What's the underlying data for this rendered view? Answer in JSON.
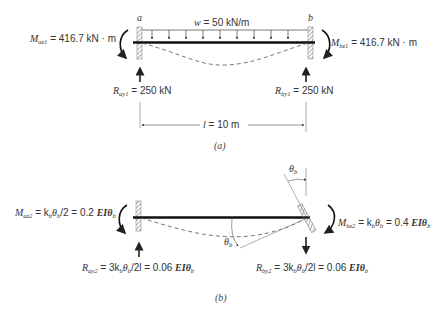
{
  "figure_a": {
    "caption": "(a)",
    "support_a_label": "a",
    "support_b_label": "b",
    "load": {
      "symbol": "w",
      "value": " = 50 kN/m"
    },
    "moment_a": {
      "symbol": "M",
      "sub": "az1",
      "value": " = 416.7 kN · m"
    },
    "moment_b": {
      "symbol": "M",
      "sub": "bz1",
      "value": " = 416.7 kN · m"
    },
    "reaction_a": {
      "symbol": "R",
      "sub": "ay1",
      "value": " = 250 kN"
    },
    "reaction_b": {
      "symbol": "R",
      "sub": "by1",
      "value": " = 250 kN"
    },
    "span": {
      "symbol": "l",
      "value": " = 10 m"
    }
  },
  "figure_b": {
    "caption": "(b)",
    "moment_a": {
      "symbol": "M",
      "sub": "az2",
      "value": " = k",
      "k_sub": "b",
      "theta": "θ",
      "theta_sub": "b",
      "rest": "/2 = 0.2 ",
      "ei": "EIθ",
      "ei_sub": "b"
    },
    "moment_b": {
      "symbol": "M",
      "sub": "bz2",
      "value": " = k",
      "k_sub": "b",
      "theta": "θ",
      "theta_sub": "b",
      "rest": " = 0.4 ",
      "ei": "EIθ",
      "ei_sub": "b"
    },
    "reaction_a": {
      "symbol": "R",
      "sub": "ay2",
      "value": " = 3k",
      "k_sub": "b",
      "theta": "θ",
      "theta_sub": "b",
      "rest": "/2l = 0.06 ",
      "ei": "EIθ",
      "ei_sub": "b"
    },
    "reaction_b": {
      "symbol": "R",
      "sub": "by2",
      "value": " = 3k",
      "k_sub": "b",
      "theta": "θ",
      "theta_sub": "b",
      "rest": "/2l = 0.06 ",
      "ei": "EIθ",
      "ei_sub": "b"
    },
    "rotation_top": {
      "symbol": "θ",
      "sub": "b"
    },
    "rotation_mid": {
      "symbol": "θ",
      "sub": "b"
    }
  }
}
